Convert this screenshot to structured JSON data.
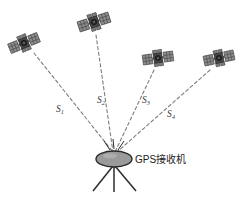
{
  "diagram": {
    "background_color": "#ffffff",
    "line_color": "#7d7d7d",
    "satellite_body_color": "#4a4a4a",
    "satellite_panel_color": "#8d8d8d",
    "receiver_fill_color": "#9a9a9a",
    "receiver_stroke_color": "#2b2b2b",
    "label_color": "#3a3a3a"
  },
  "satellites": [
    {
      "id": "satellite-1",
      "x": 24,
      "y": 43,
      "rotation": -22,
      "range_label": "S",
      "range_subscript": "1",
      "label_x": 56,
      "label_y": 112
    },
    {
      "id": "satellite-2",
      "x": 94,
      "y": 22,
      "rotation": -18,
      "range_label": "S",
      "range_subscript": "2",
      "label_x": 97,
      "label_y": 103
    },
    {
      "id": "satellite-3",
      "x": 158,
      "y": 58,
      "rotation": -8,
      "range_label": "S",
      "range_subscript": "3",
      "label_x": 142,
      "label_y": 103
    },
    {
      "id": "satellite-4",
      "x": 219,
      "y": 58,
      "rotation": -12,
      "range_label": "S",
      "range_subscript": "4",
      "label_x": 167,
      "label_y": 117
    }
  ],
  "receiver": {
    "caption": "GPS接收机",
    "caption_x": 131,
    "caption_y": 162,
    "antenna_center_x": 114,
    "antenna_center_y": 160,
    "antenna_rx": 18,
    "antenna_ry": 8,
    "convergence_x": 114,
    "convergence_y": 153,
    "tripod_base_y": 192
  },
  "signal_rays": [
    {
      "x1": 110,
      "y1": 150,
      "x2": 104,
      "y2": 142
    },
    {
      "x1": 114,
      "y1": 149,
      "x2": 113,
      "y2": 140
    },
    {
      "x1": 118,
      "y1": 150,
      "x2": 123,
      "y2": 142
    }
  ]
}
